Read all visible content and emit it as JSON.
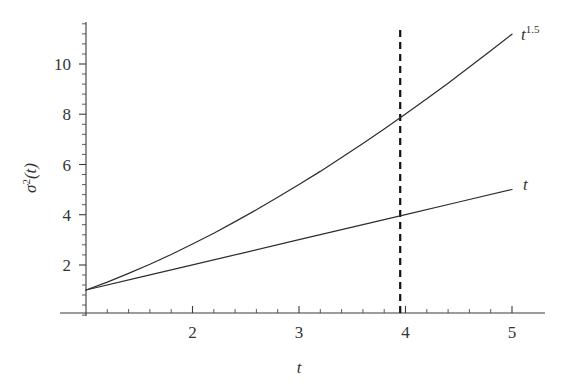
{
  "chart_data": {
    "type": "line",
    "title": "",
    "xlabel": "t",
    "ylabel": "σ²(t)",
    "xlim": [
      1,
      5
    ],
    "ylim": [
      0,
      11.6
    ],
    "grid": false,
    "legend_position": "inline-right-of-curve-ends",
    "xticks": [
      2,
      3,
      4,
      5
    ],
    "xtick_labels": [
      "2",
      "3",
      "4",
      "5"
    ],
    "yticks": [
      2,
      4,
      6,
      8,
      10
    ],
    "ytick_labels": [
      "2",
      "4",
      "6",
      "8",
      "10"
    ],
    "x_minor_tick_step": 0.2,
    "y_minor_tick_step": 0.4,
    "series": [
      {
        "name": "t^1.5",
        "label": "t",
        "label_exponent": "1.5",
        "color": "#2e2e2e",
        "style": "solid",
        "x": [
          1.0,
          1.2,
          1.4,
          1.6,
          1.8,
          2.0,
          2.2,
          2.4,
          2.6,
          2.8,
          3.0,
          3.2,
          3.4,
          3.6,
          3.8,
          4.0,
          4.2,
          4.4,
          4.6,
          4.8,
          5.0
        ],
        "y": [
          1.0,
          1.31,
          1.66,
          2.02,
          2.41,
          2.83,
          3.26,
          3.72,
          4.19,
          4.69,
          5.2,
          5.72,
          6.27,
          6.83,
          7.41,
          8.0,
          8.61,
          9.23,
          9.87,
          10.52,
          11.18
        ]
      },
      {
        "name": "t",
        "label": "t",
        "label_exponent": "",
        "color": "#2e2e2e",
        "style": "solid",
        "x": [
          1.0,
          1.5,
          2.0,
          2.5,
          3.0,
          3.5,
          4.0,
          4.5,
          5.0
        ],
        "y": [
          1.0,
          1.5,
          2.0,
          2.5,
          3.0,
          3.5,
          4.0,
          4.5,
          5.0
        ]
      }
    ],
    "annotations": [
      {
        "name": "vertical-marker",
        "type": "vline",
        "x": 3.95,
        "y_from": 0,
        "y_to": 11.4,
        "style": "dashed",
        "color": "#111111"
      }
    ]
  },
  "labels": {
    "y_axis_title": "σ²(t)",
    "x_axis_title": "t",
    "upper_curve_base": "t",
    "upper_curve_exponent": "1.5",
    "lower_curve": "t"
  }
}
